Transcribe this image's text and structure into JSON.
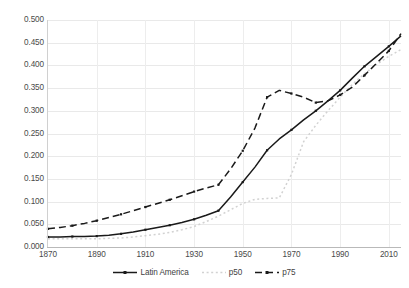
{
  "chart_data": {
    "type": "line",
    "title": "",
    "subtitle": "",
    "xlabel": "",
    "ylabel": "",
    "xlim": [
      1870,
      2015
    ],
    "ylim": [
      0.0,
      0.5
    ],
    "grid": true,
    "legend_position": "bottom",
    "x_ticks": [
      "1870",
      "1890",
      "1910",
      "1930",
      "1950",
      "1970",
      "1990",
      "2010"
    ],
    "x_tick_values": [
      1870,
      1890,
      1910,
      1930,
      1950,
      1970,
      1990,
      2010
    ],
    "y_ticks": [
      "0.000",
      "0.050",
      "0.100",
      "0.150",
      "0.200",
      "0.250",
      "0.300",
      "0.350",
      "0.400",
      "0.450",
      "0.500"
    ],
    "y_tick_values": [
      0.0,
      0.05,
      0.1,
      0.15,
      0.2,
      0.25,
      0.3,
      0.35,
      0.4,
      0.45,
      0.5
    ],
    "x": [
      1870,
      1875,
      1880,
      1885,
      1890,
      1895,
      1900,
      1905,
      1910,
      1915,
      1920,
      1925,
      1930,
      1935,
      1940,
      1945,
      1950,
      1955,
      1960,
      1965,
      1970,
      1975,
      1980,
      1985,
      1990,
      1995,
      2000,
      2005,
      2010,
      2015
    ],
    "series": [
      {
        "name": "Latin America",
        "style": "solid",
        "color": "#1a1a1a",
        "marker": true,
        "values": [
          0.022,
          0.022,
          0.023,
          0.023,
          0.024,
          0.026,
          0.029,
          0.033,
          0.038,
          0.043,
          0.048,
          0.054,
          0.061,
          0.07,
          0.08,
          0.11,
          0.143,
          0.176,
          0.213,
          0.238,
          0.258,
          0.28,
          0.3,
          0.322,
          0.345,
          0.372,
          0.398,
          0.42,
          0.442,
          0.465
        ]
      },
      {
        "name": "p50",
        "style": "dotted",
        "color": "#d2d2d2",
        "marker": false,
        "values": [
          0.018,
          0.018,
          0.018,
          0.018,
          0.018,
          0.019,
          0.02,
          0.022,
          0.025,
          0.028,
          0.032,
          0.038,
          0.045,
          0.056,
          0.068,
          0.082,
          0.096,
          0.105,
          0.107,
          0.108,
          0.16,
          0.232,
          0.268,
          0.3,
          0.33,
          0.358,
          0.382,
          0.402,
          0.42,
          0.435
        ]
      },
      {
        "name": "p75",
        "style": "dashed",
        "color": "#1a1a1a",
        "marker": true,
        "values": [
          0.04,
          0.043,
          0.047,
          0.052,
          0.058,
          0.065,
          0.072,
          0.08,
          0.088,
          0.096,
          0.104,
          0.113,
          0.122,
          0.13,
          0.137,
          0.172,
          0.212,
          0.262,
          0.33,
          0.345,
          0.338,
          0.33,
          0.318,
          0.322,
          0.335,
          0.352,
          0.378,
          0.405,
          0.432,
          0.47
        ]
      }
    ]
  },
  "legend": {
    "items": [
      {
        "label": "Latin America",
        "key": "latin-america"
      },
      {
        "label": "p50",
        "key": "p50"
      },
      {
        "label": "p75",
        "key": "p75"
      }
    ]
  },
  "colors": {
    "line_dark": "#1a1a1a",
    "line_light": "#d2d2d2",
    "grid": "#e9e9e9",
    "axis": "#b9b9b9",
    "text": "#4a4a4a",
    "background": "#ffffff"
  }
}
